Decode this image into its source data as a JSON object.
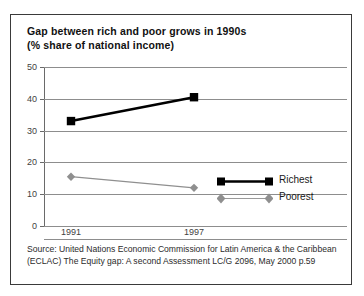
{
  "chart_data": {
    "type": "line",
    "title": "Gap between rich and poor grows in 1990s",
    "subtitle": "(% share of national income)",
    "xlabel": "",
    "ylabel": "",
    "categories": [
      "1991",
      "1997"
    ],
    "x_tick_labels": [
      "1991",
      "1997"
    ],
    "y_tick_labels": [
      "0",
      "10",
      "20",
      "30",
      "40",
      "50"
    ],
    "y_ticks": [
      0,
      10,
      20,
      30,
      40,
      50
    ],
    "ylim": [
      0,
      50
    ],
    "grid": "horizontal",
    "legend_position": "inside-right",
    "series": [
      {
        "name": "Richest",
        "values": [
          33,
          40.5
        ],
        "color": "#000000",
        "marker": "square",
        "line_width": 2.6
      },
      {
        "name": "Poorest",
        "values": [
          15.5,
          12
        ],
        "color": "#8f8f8f",
        "marker": "diamond",
        "line_width": 1.2
      }
    ],
    "source_lines": [
      "Source: United Nations Economic Commission for Latin America & the Caribbean",
      "(ECLAC) The Equity gap: A second Assessment LC/G 2096, May 2000 p.59"
    ]
  },
  "frame": {
    "border_color": "#3a3a3a",
    "background": "#ffffff"
  }
}
